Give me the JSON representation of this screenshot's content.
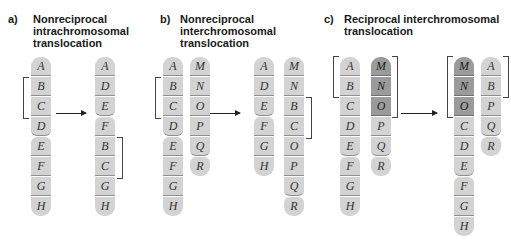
{
  "panels": [
    {
      "letter": "a)",
      "title": "Nonreciprocal\nintrachromosomal\ntranslocation"
    },
    {
      "letter": "b)",
      "title": "Nonreciprocal\ninterchromosomal\ntranslocation"
    },
    {
      "letter": "c)",
      "title": "Reciprocal interchromosomal\ntranslocation"
    }
  ],
  "chromosomes": {
    "a_before": [
      "A",
      "B",
      "C",
      "D",
      "E",
      "F",
      "G",
      "H"
    ],
    "a_after": [
      "A",
      "D",
      "E",
      "F",
      "B",
      "C",
      "G",
      "H"
    ],
    "b_before_1": [
      "A",
      "B",
      "C",
      "D",
      "E",
      "F",
      "G",
      "H"
    ],
    "b_before_2": [
      "M",
      "N",
      "O",
      "P",
      "Q",
      "R"
    ],
    "b_after_1": [
      "A",
      "D",
      "E",
      "F",
      "G",
      "H"
    ],
    "b_after_2": [
      "M",
      "N",
      "B",
      "C",
      "O",
      "P",
      "Q",
      "R"
    ],
    "c_before_1": [
      "A",
      "B",
      "C",
      "D",
      "E",
      "F",
      "G",
      "H"
    ],
    "c_before_2": [
      "M",
      "N",
      "O",
      "P",
      "Q",
      "R"
    ],
    "c_after_1": [
      "M",
      "N",
      "O",
      "C",
      "D",
      "E",
      "F",
      "G",
      "H"
    ],
    "c_after_2": [
      "A",
      "B",
      "P",
      "Q",
      "R"
    ]
  },
  "colors": {
    "segment_light": "#d3d3d3",
    "segment_dark": "#9b9b9b",
    "text": "#333333"
  }
}
